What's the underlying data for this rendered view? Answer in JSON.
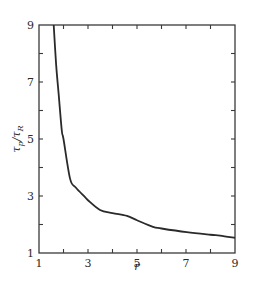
{
  "chart_data": {
    "type": "line",
    "title": "",
    "xlabel": "r",
    "ylabel": "τp/τR",
    "ylabel_parts": {
      "main": "τ",
      "sub1": "p",
      "slash": "/",
      "main2": "τ",
      "sub2": "R"
    },
    "xlim": [
      1,
      9
    ],
    "ylim": [
      1,
      9
    ],
    "grid": false,
    "legend": null,
    "x_ticks_major": [
      1,
      3,
      5,
      7,
      9
    ],
    "x_ticks_minor": [
      2,
      4,
      6,
      8
    ],
    "y_ticks_major": [
      1,
      3,
      5,
      7,
      9
    ],
    "y_ticks_minor": [
      2,
      4,
      6,
      8
    ],
    "x_tick_labels": [
      "1",
      "3",
      "5",
      "7",
      "9"
    ],
    "y_tick_labels": [
      "1",
      "3",
      "5",
      "7",
      "9"
    ],
    "series": [
      {
        "name": "τp/τR vs r",
        "x": [
          1.6,
          1.7,
          1.8,
          1.93,
          2.0,
          2.27,
          2.5,
          2.88,
          3.0,
          3.49,
          4.0,
          4.59,
          5.0,
          5.65,
          6.0,
          7.03,
          8.0,
          8.39,
          9.0
        ],
        "y": [
          9.0,
          7.6,
          6.6,
          5.3,
          5.0,
          3.6,
          3.3,
          2.96,
          2.85,
          2.51,
          2.4,
          2.3,
          2.15,
          1.92,
          1.86,
          1.73,
          1.64,
          1.61,
          1.53
        ],
        "color": "#2a2a2a"
      }
    ],
    "colors": {
      "line": "#2a2a2a",
      "frame": "#3a3a3a",
      "background": "#ffffff"
    }
  },
  "plot_box": {
    "left": 39,
    "top": 25,
    "right": 235,
    "bottom": 253
  }
}
